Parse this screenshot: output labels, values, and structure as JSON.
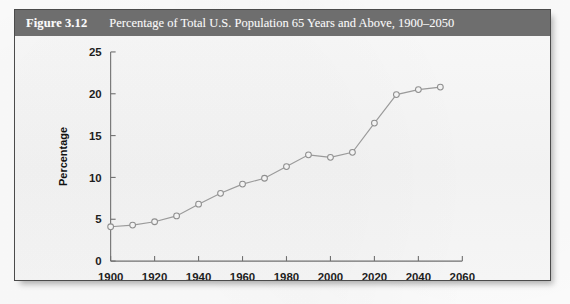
{
  "figure": {
    "number_label": "Figure 3.12",
    "caption": "Percentage of Total U.S. Population 65 Years and Above, 1900–2050",
    "band_color": "#6e6e6e",
    "border_color": "#4b4b4b",
    "panel_color": "#f4f4f4"
  },
  "chart_data": {
    "type": "line",
    "title": "Percentage of Total U.S. Population 65 Years and Above, 1900–2050",
    "xlabel": "",
    "ylabel": "Percentage",
    "xlim": [
      1900,
      2060
    ],
    "ylim": [
      0,
      25
    ],
    "xticks": [
      1900,
      1920,
      1940,
      1960,
      1980,
      2000,
      2020,
      2040,
      2060
    ],
    "xtick_labels": [
      "1900",
      "1920",
      "1940",
      "1960",
      "1980",
      "2000",
      "2020",
      "2040",
      "2060"
    ],
    "yticks": [
      0,
      5,
      10,
      15,
      20,
      25
    ],
    "ytick_labels": [
      "0",
      "5",
      "10",
      "15",
      "20",
      "25"
    ],
    "grid": false,
    "legend": null,
    "marker": "open-circle",
    "line_color": "#9a9a9a",
    "marker_fill": "#f3f3f3",
    "x": [
      1900,
      1910,
      1920,
      1930,
      1940,
      1950,
      1960,
      1970,
      1980,
      1990,
      2000,
      2010,
      2020,
      2030,
      2040,
      2050
    ],
    "values": [
      4.1,
      4.3,
      4.7,
      5.4,
      6.8,
      8.1,
      9.2,
      9.9,
      11.3,
      12.7,
      12.4,
      13.0,
      16.5,
      19.9,
      20.5,
      20.8
    ],
    "series": [
      {
        "name": "Percentage of Total U.S. Population 65 Years and Above",
        "values": [
          4.1,
          4.3,
          4.7,
          5.4,
          6.8,
          8.1,
          9.2,
          9.9,
          11.3,
          12.7,
          12.4,
          13.0,
          16.5,
          19.9,
          20.5,
          20.8
        ]
      }
    ]
  }
}
